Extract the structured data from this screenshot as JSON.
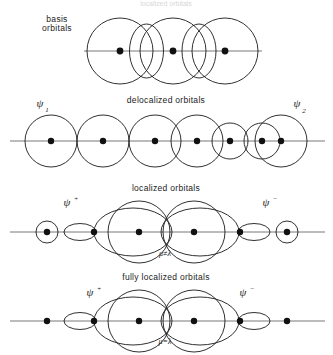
{
  "figure": {
    "top_cut_text": "localized orbitals",
    "axis_color": "#555555",
    "stroke_color": "#1a1a1a"
  },
  "panels": [
    {
      "id": "basis",
      "title_line1": "basis",
      "title_line2": "orbitals",
      "title_position": "left",
      "axis_y": 51,
      "centers": [
        120,
        173,
        225
      ],
      "big_radius": 33,
      "lens_centers": [
        146.5,
        199
      ],
      "lens_rx": 17,
      "lens_ry": 27,
      "left_label_x": 57,
      "left_label_y1": 22,
      "left_label_y2": 31
    },
    {
      "id": "delocalized",
      "title": "delocalized orbitals",
      "title_x": 166,
      "title_y": 103,
      "axis_y": 141,
      "left_circle_centers": [
        51,
        103,
        155
      ],
      "left_circle_radius": 26,
      "right_big_centers": [
        197,
        281
      ],
      "right_big_radius": 26,
      "right_small_centers": [
        230,
        262
      ],
      "right_small_radius": 18,
      "dots": [
        51,
        103,
        155,
        197,
        230,
        262,
        281
      ],
      "psi_left": {
        "symbol": "ψ",
        "sub": "1",
        "x": 40,
        "y": 107
      },
      "psi_right": {
        "symbol": "ψ",
        "sub": "2",
        "x": 297,
        "y": 107
      }
    },
    {
      "id": "localized",
      "title": "localized orbitals",
      "title_x": 166,
      "title_y": 191,
      "axis_y": 232,
      "annotation": "μ≠λ",
      "annotation_x": 165,
      "annotation_y": 256,
      "end_small_centers": [
        47,
        287
      ],
      "end_small_radius": 11,
      "end_lens_centers": [
        80,
        254
      ],
      "end_lens_rx": 16,
      "end_lens_ry": 8.5,
      "big_centers": [
        139,
        194
      ],
      "big_radius": 31,
      "inner_ellipse_rx": 39,
      "inner_ellipse_ry": 24,
      "dots": [
        47,
        94,
        139,
        194,
        240,
        287
      ],
      "psi_plus": {
        "symbol": "ψ",
        "sup": "+",
        "x": 67,
        "y": 206
      },
      "psi_minus": {
        "symbol": "ψ",
        "sup": "−",
        "x": 266,
        "y": 206
      }
    },
    {
      "id": "fully-localized",
      "title": "fully localized orbitals",
      "title_x": 166,
      "title_y": 280,
      "axis_y": 321,
      "annotation": "μ=λ",
      "annotation_x": 165,
      "annotation_y": 344,
      "bare_dots": [
        47,
        287
      ],
      "end_lens_centers": [
        80,
        254
      ],
      "end_lens_rx": 16,
      "end_lens_ry": 8.5,
      "big_centers": [
        139,
        194
      ],
      "big_radius": 31,
      "inner_ellipse_rx": 39,
      "inner_ellipse_ry": 24,
      "dots": [
        47,
        94,
        139,
        194,
        240,
        287
      ],
      "psi_plus": {
        "symbol": "ψ",
        "sup": "+",
        "x": 90,
        "y": 296
      },
      "psi_minus": {
        "symbol": "ψ",
        "sup": "−",
        "x": 243,
        "y": 296
      }
    }
  ]
}
